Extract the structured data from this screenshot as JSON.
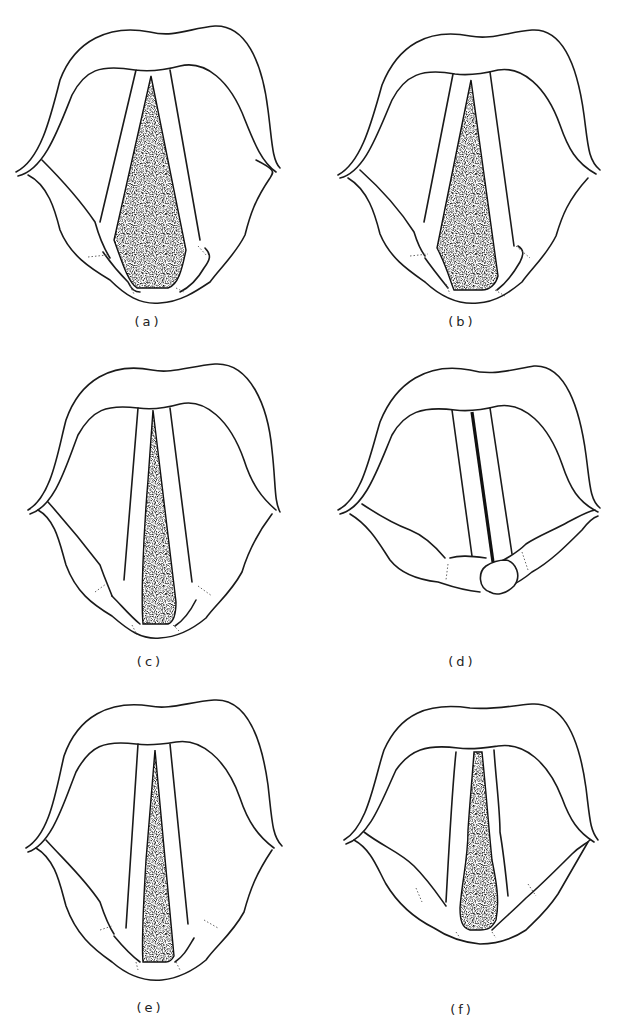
{
  "figure": {
    "panels": [
      {
        "id": "a",
        "label": "(a)",
        "state": "wide open glottis, arytenoids spread"
      },
      {
        "id": "b",
        "label": "(b)",
        "state": "open glottis, narrower triangle"
      },
      {
        "id": "c",
        "label": "(c)",
        "state": "narrow elongated triangular opening"
      },
      {
        "id": "d",
        "label": "(d)",
        "state": "glottis closed, thin line, arytenoids overlapping"
      },
      {
        "id": "e",
        "label": "(e)",
        "state": "narrow tapering opening"
      },
      {
        "id": "f",
        "label": "(f)",
        "state": "irregular narrow opening, uneven fold edges"
      }
    ],
    "colors": {
      "line": "#1a1a1a",
      "background": "#ffffff",
      "fill": "#2a2a2a"
    }
  }
}
